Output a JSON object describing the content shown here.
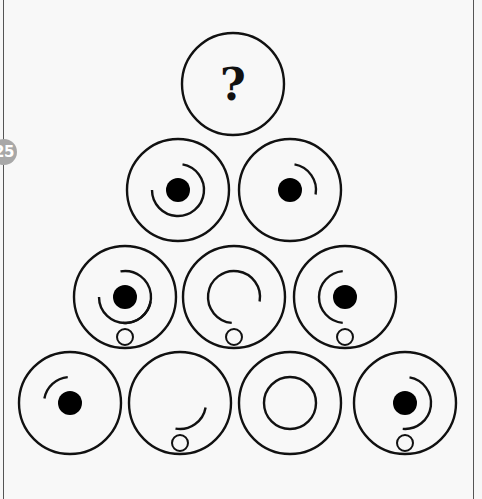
{
  "puzzle": {
    "number_badge": "25",
    "question_mark": "?",
    "colors": {
      "stroke": "#111111",
      "dot_fill": "#000000",
      "badge_bg": "#a8a8a8",
      "badge_text": "#ffffff",
      "background": "#f8f8f8"
    },
    "rows": [
      {
        "cells": [
          {
            "id": "top",
            "unknown": true,
            "dot": false,
            "small_circle": false,
            "arcs": []
          }
        ]
      },
      {
        "cells": [
          {
            "id": "r2c1",
            "unknown": false,
            "dot": true,
            "small_circle": false,
            "arcs": [
              [
                -80,
                180
              ]
            ]
          },
          {
            "id": "r2c2",
            "unknown": false,
            "dot": true,
            "small_circle": false,
            "arcs": [
              [
                -80,
                10
              ]
            ]
          }
        ]
      },
      {
        "cells": [
          {
            "id": "r3c1",
            "unknown": false,
            "dot": true,
            "small_circle": true,
            "arcs": [
              [
                -100,
                180
              ],
              [
                10,
                95
              ]
            ]
          },
          {
            "id": "r3c2",
            "unknown": false,
            "dot": false,
            "small_circle": true,
            "arcs": [
              [
                95,
                370
              ]
            ]
          },
          {
            "id": "r3c3",
            "unknown": false,
            "dot": true,
            "small_circle": true,
            "arcs": [
              [
                95,
                265
              ]
            ]
          }
        ]
      },
      {
        "cells": [
          {
            "id": "r4c1",
            "unknown": false,
            "dot": true,
            "small_circle": false,
            "arcs": [
              [
                -170,
                -95
              ]
            ]
          },
          {
            "id": "r4c2",
            "unknown": false,
            "dot": false,
            "small_circle": true,
            "arcs": [
              [
                10,
                100
              ]
            ]
          },
          {
            "id": "r4c3",
            "unknown": false,
            "dot": false,
            "small_circle": false,
            "arcs": [
              [
                0,
                360
              ]
            ]
          },
          {
            "id": "r4c4",
            "unknown": false,
            "dot": true,
            "small_circle": true,
            "arcs": [
              [
                -80,
                95
              ]
            ]
          }
        ]
      }
    ]
  }
}
